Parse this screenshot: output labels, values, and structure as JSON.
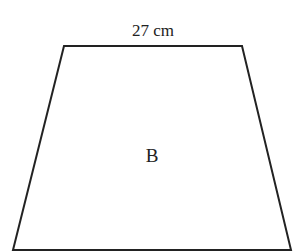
{
  "diagram": {
    "shape": "trapezoid",
    "top_side_label": "27 cm",
    "center_label": "B",
    "stroke_color": "#222222",
    "background_color": "#ffffff",
    "vertices": {
      "top_left": [
        64,
        46
      ],
      "top_right": [
        242,
        46
      ],
      "bottom_right": [
        291,
        250
      ],
      "bottom_left": [
        13,
        250
      ]
    }
  }
}
